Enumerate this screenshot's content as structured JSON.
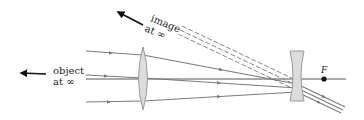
{
  "diagram": {
    "labels": {
      "object_line1": "object",
      "object_line2": "at ∞",
      "image_line1": "image",
      "image_line2": "at ∞",
      "focal_point": "F"
    },
    "elements": {
      "objective_lens": "converging (convex) lens",
      "eyepiece_lens": "diverging (concave) lens",
      "optical_axis": "horizontal axis",
      "focal_point_marker": "dot at F"
    },
    "colors": {
      "ray": "#7a7a7a",
      "axis": "#555555",
      "lens_fill": "#dcdcdc",
      "lens_stroke": "#9a9a9a",
      "arrow": "#111111",
      "text": "#222222"
    }
  }
}
